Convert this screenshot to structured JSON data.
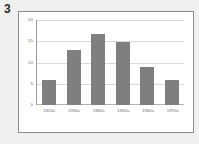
{
  "figure": {
    "number_label": "3"
  },
  "colors": {
    "bar": "#7f7f7f",
    "grid": "#d9d9d9",
    "axis": "#9a9a9a",
    "frame_border": "#8d8d8d",
    "plot_background": "#ffffff",
    "page_background": "#f0f0ef",
    "tick_text": "#6a6a6a"
  },
  "chart_data": {
    "type": "bar",
    "title": "",
    "xlabel": "",
    "ylabel": "",
    "categories": [
      "1920s",
      "1930s",
      "1940s",
      "1950s",
      "1960s",
      "1970s"
    ],
    "values": [
      6,
      13,
      17,
      15,
      9,
      6
    ],
    "ylim": [
      0,
      20
    ],
    "yticks": [
      0,
      5,
      10,
      15,
      20
    ],
    "ytick_labels": [
      "0",
      "5",
      "10",
      "15",
      "20"
    ],
    "grid": true,
    "grid_axis": "y",
    "legend": false,
    "legend_position": "none",
    "series": [
      {
        "name": "",
        "values": [
          6,
          13,
          17,
          15,
          9,
          6
        ]
      }
    ]
  }
}
